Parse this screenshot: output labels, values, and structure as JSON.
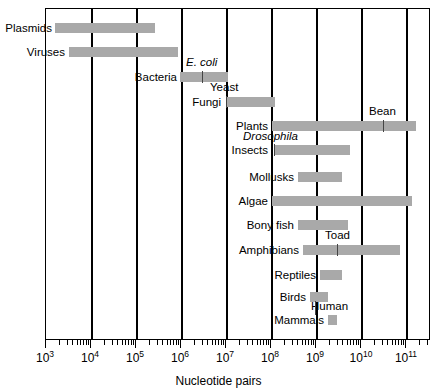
{
  "chart_data": {
    "type": "bar",
    "title": "",
    "subtitle": "",
    "xlabel": "Nucleotide pairs",
    "ylabel": "",
    "scale": "log10",
    "xlim": [
      1000,
      300000000000
    ],
    "grid": true,
    "legend_position": "none",
    "orientation": "horizontal",
    "bar_color": "#a9a9a9",
    "axis_color": "#000000",
    "tick_labels": [
      {
        "label": "10",
        "exponent": "3",
        "value": 1000
      },
      {
        "label": "10",
        "exponent": "4",
        "value": 10000
      },
      {
        "label": "10",
        "exponent": "5",
        "value": 100000
      },
      {
        "label": "10",
        "exponent": "6",
        "value": 1000000
      },
      {
        "label": "10",
        "exponent": "7",
        "value": 10000000
      },
      {
        "label": "10",
        "exponent": "8",
        "value": 100000000
      },
      {
        "label": "10",
        "exponent": "9",
        "value": 1000000000
      },
      {
        "label": "10",
        "exponent": "10",
        "value": 10000000000
      },
      {
        "label": "10",
        "exponent": "11",
        "value": 100000000000
      }
    ],
    "categories": [
      "Plasmids",
      "Viruses",
      "Bacteria",
      "Fungi",
      "Plants",
      "Insects",
      "Mollusks",
      "Algae",
      "Bony fish",
      "Amphibians",
      "Reptiles",
      "Birds",
      "Mammals"
    ],
    "ranges": [
      {
        "name": "Plasmids",
        "min": 1600,
        "max": 260000
      },
      {
        "name": "Viruses",
        "min": 3500,
        "max": 1400000
      },
      {
        "name": "Bacteria",
        "min": 1000000,
        "max": 11000000
      },
      {
        "name": "Fungi",
        "min": 10000000,
        "max": 120000000
      },
      {
        "name": "Plants",
        "min": 100000000,
        "max": 170000000000
      },
      {
        "name": "Insects",
        "min": 100000000,
        "max": 6000000000
      },
      {
        "name": "Mollusks",
        "min": 480000000,
        "max": 4500000000
      },
      {
        "name": "Algae",
        "min": 100000000,
        "max": 130000000000
      },
      {
        "name": "Bony fish",
        "min": 480000000,
        "max": 6000000000
      },
      {
        "name": "Amphibians",
        "min": 750000000,
        "max": 70000000000
      },
      {
        "name": "Reptiles",
        "min": 1500000000,
        "max": 4500000000
      },
      {
        "name": "Birds",
        "min": 800000000,
        "max": 2200000000
      },
      {
        "name": "Mammals",
        "min": 2200000000,
        "max": 3500000000
      }
    ],
    "markers": [
      {
        "name": "E. coli",
        "organism_of": "Bacteria",
        "value": 4600000,
        "italic": true
      },
      {
        "name": "Yeast",
        "organism_of": "Fungi",
        "value": 12000000,
        "italic": false
      },
      {
        "name": "Bean",
        "organism_of": "Plants",
        "value": 14000000000,
        "italic": false
      },
      {
        "name": "Drosophila",
        "organism_of": "Insects",
        "value": 120000000,
        "italic": true
      },
      {
        "name": "Toad",
        "organism_of": "Amphibians",
        "value": 3000000000,
        "italic": false
      },
      {
        "name": "Human",
        "organism_of": "Mammals",
        "value": 3000000000,
        "italic": false
      }
    ]
  },
  "axis": {
    "x_title": "Nucleotide pairs"
  },
  "labels": {
    "plasmids": "Plasmids",
    "viruses": "Viruses",
    "bacteria": "Bacteria",
    "fungi": "Fungi",
    "plants": "Plants",
    "insects": "Insects",
    "mollusks": "Mollusks",
    "algae": "Algae",
    "bony_fish": "Bony fish",
    "amphibians": "Amphibians",
    "reptiles": "Reptiles",
    "birds": "Birds",
    "mammals": "Mammals"
  },
  "markers": {
    "ecoli": "E. coli",
    "yeast": "Yeast",
    "bean": "Bean",
    "drosophila": "Drosophila",
    "toad": "Toad",
    "human": "Human"
  }
}
